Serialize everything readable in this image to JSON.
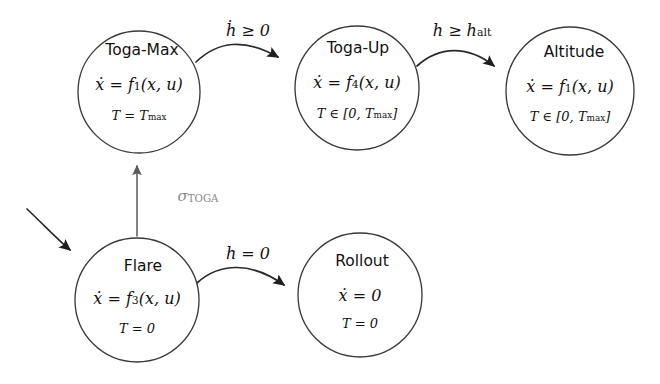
{
  "diagram": {
    "type": "state-machine",
    "background_color": "#ffffff",
    "stroke_color": "#2b2b2b",
    "muted_label_color": "#8a8a8a"
  },
  "nodes": [
    {
      "id": "toga-max",
      "name": "Toga-Max",
      "dynamics": "ẋ = f₁(x, u)",
      "dynamics_f_index": "1",
      "constraint": "T = T_max",
      "cx": 139,
      "cy": 92,
      "r": 61
    },
    {
      "id": "toga-up",
      "name": "Toga-Up",
      "dynamics": "ẋ = f₄(x, u)",
      "dynamics_f_index": "4",
      "constraint": "T ∈ [0, T_max]",
      "cx": 357,
      "cy": 88,
      "r": 62
    },
    {
      "id": "altitude",
      "name": "Altitude",
      "dynamics": "ẋ = f₁(x, u)",
      "dynamics_f_index": "1",
      "constraint": "T ∈ [0, T_max]",
      "cx": 570,
      "cy": 91,
      "r": 64
    },
    {
      "id": "flare",
      "name": "Flare",
      "dynamics": "ẋ = f₃(x, u)",
      "dynamics_f_index": "3",
      "constraint": "T = 0",
      "cx": 137,
      "cy": 300,
      "r": 62
    },
    {
      "id": "rollout",
      "name": "Rollout",
      "dynamics": "ẋ = 0",
      "dynamics_f_index": "",
      "constraint": "T = 0",
      "cx": 360,
      "cy": 295,
      "r": 62
    }
  ],
  "edges": [
    {
      "id": "toga-max-to-toga-up",
      "from": "toga-max",
      "to": "toga-up",
      "label": "ḣ ≥ 0",
      "label_x": 248,
      "label_y": 31,
      "style": "curved-arc",
      "muted": false
    },
    {
      "id": "toga-up-to-altitude",
      "from": "toga-up",
      "to": "altitude",
      "label": "h ≥ h_alt",
      "label_x": 464,
      "label_y": 31,
      "style": "curved-arc",
      "muted": false
    },
    {
      "id": "flare-to-toga-max",
      "from": "flare",
      "to": "toga-max",
      "label": "σ_TOGA",
      "label_x": 198,
      "label_y": 197,
      "style": "straight-vertical",
      "muted": true
    },
    {
      "id": "flare-to-rollout",
      "from": "flare",
      "to": "rollout",
      "label": "h = 0",
      "label_x": 250,
      "label_y": 254,
      "style": "curved-arc",
      "muted": false
    },
    {
      "id": "initial-to-flare",
      "from": "",
      "to": "flare",
      "label": "",
      "label_x": 0,
      "label_y": 0,
      "style": "initial-entry",
      "muted": false
    }
  ],
  "labels": {
    "hdot_geq_zero": "ḣ ≥ 0",
    "h_geq_halt": "h ≥ h",
    "h_alt_sub": "alt",
    "sigma_symbol": "σ",
    "sigma_sub": "TOGA",
    "h_eq_zero": "h = 0",
    "T_eq_Tmax_main": "T = T",
    "T_max_sub": "max",
    "T_in_interval_open": "T ∈ [0, T",
    "T_in_interval_close": "]",
    "T_eq_zero": "T = 0",
    "xdot_eq": "ẋ = f",
    "xdot_args": "(x, u)",
    "xdot_eq_zero": "ẋ = 0"
  }
}
